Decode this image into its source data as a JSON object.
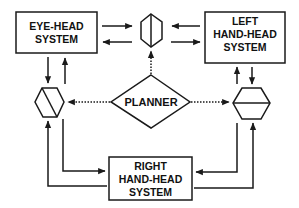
{
  "diagram": {
    "colors": {
      "stroke": "#1a1a1a",
      "background": "#ffffff",
      "text": "#111111"
    },
    "nodes": {
      "eye_head": {
        "lines": [
          "EYE-HEAD",
          "SYSTEM"
        ]
      },
      "left_hand_head": {
        "lines": [
          "LEFT",
          "HAND-HEAD",
          "SYSTEM"
        ]
      },
      "right_hand_head": {
        "lines": [
          "RIGHT",
          "HAND-HEAD",
          "SYSTEM"
        ]
      },
      "planner": {
        "label": "PLANNER"
      },
      "hex_top": {
        "shape": "hexagon",
        "divider": "vertical"
      },
      "hex_left": {
        "shape": "hexagon",
        "divider": "diagonal"
      },
      "hex_right": {
        "shape": "hexagon",
        "divider": "horizontal"
      }
    },
    "edges": [
      {
        "from": "eye_head",
        "to": "hex_top",
        "style": "solid"
      },
      {
        "from": "hex_top",
        "to": "eye_head",
        "style": "solid"
      },
      {
        "from": "left_hand_head",
        "to": "hex_top",
        "style": "solid"
      },
      {
        "from": "hex_top",
        "to": "left_hand_head",
        "style": "solid"
      },
      {
        "from": "eye_head",
        "to": "hex_left",
        "style": "solid"
      },
      {
        "from": "hex_left",
        "to": "eye_head",
        "style": "solid"
      },
      {
        "from": "left_hand_head",
        "to": "hex_right",
        "style": "solid"
      },
      {
        "from": "hex_right",
        "to": "left_hand_head",
        "style": "solid"
      },
      {
        "from": "hex_left",
        "to": "right_hand_head",
        "style": "solid"
      },
      {
        "from": "right_hand_head",
        "to": "hex_left",
        "style": "solid"
      },
      {
        "from": "hex_right",
        "to": "right_hand_head",
        "style": "solid"
      },
      {
        "from": "right_hand_head",
        "to": "hex_right",
        "style": "solid"
      },
      {
        "from": "planner",
        "to": "hex_top",
        "style": "dotted"
      },
      {
        "from": "planner",
        "to": "hex_left",
        "style": "dotted"
      },
      {
        "from": "planner",
        "to": "hex_right",
        "style": "dotted"
      }
    ]
  }
}
